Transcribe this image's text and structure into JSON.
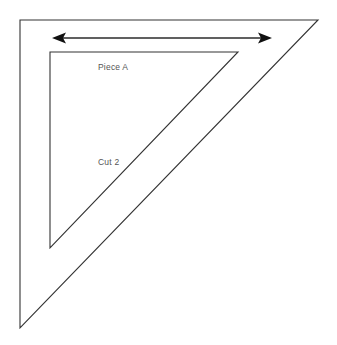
{
  "diagram": {
    "background_color": "#ffffff",
    "line_color": "#333333",
    "arrow_color": "#111111",
    "label_color": "#555555",
    "labels": {
      "piece": "Piece A",
      "cut": "Cut 2"
    },
    "outer_triangle": {
      "name": "outer-right-triangle",
      "points": "20,20 318,20 20,328"
    },
    "inner_triangle": {
      "name": "inner-right-triangle",
      "points": "50,52 238,52 50,248"
    },
    "dimension_arrow": {
      "name": "width-dimension-arrow",
      "y": 38,
      "x_start": 52,
      "x_end": 272,
      "double_headed": true
    }
  }
}
